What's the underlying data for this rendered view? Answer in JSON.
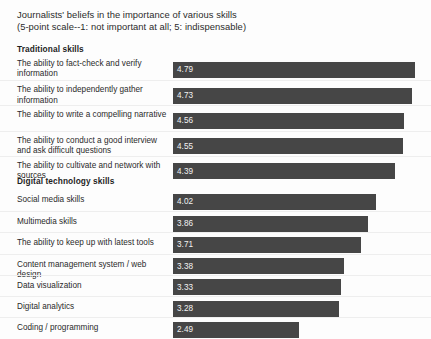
{
  "chart_data": {
    "type": "bar",
    "title": "Journalists' beliefs in the importance of various skills",
    "subtitle": "(5-point scale--1: not important at all; 5: indispensable)",
    "xlabel": "",
    "ylabel": "",
    "xlim": [
      0,
      5
    ],
    "grid": false,
    "legend": "none",
    "orientation": "horizontal",
    "value_labels_inside_bars": true,
    "bar_color": "#464646",
    "groups": [
      {
        "name": "Traditional skills",
        "categories": [
          "The ability to fact-check and verify information",
          "The ability to independently gather information",
          "The ability to write a compelling narrative",
          "The ability to conduct a good interview and ask difficult questions",
          "The ability to cultivate and network with sources"
        ],
        "values": [
          4.79,
          4.73,
          4.56,
          4.55,
          4.39
        ]
      },
      {
        "name": "Digital technology skills",
        "categories": [
          "Social media skills",
          "Multimedia skills",
          "The ability to keep up with latest tools",
          "Content management system / web design",
          "Data visualization",
          "Digital analytics",
          "Coding / programming"
        ],
        "values": [
          4.02,
          3.86,
          3.71,
          3.38,
          3.33,
          3.28,
          2.49
        ]
      }
    ]
  },
  "title": {
    "line1": "Journalists' beliefs in the importance of various skills",
    "line2": "(5-point scale--1: not important at all; 5: indispensable)"
  },
  "sections": [
    {
      "heading": "Traditional skills",
      "rows": [
        {
          "label": "The ability to fact-check and verify information",
          "value": "4.79",
          "num": 4.79
        },
        {
          "label": "The ability to independently gather information",
          "value": "4.73",
          "num": 4.73
        },
        {
          "label": "The ability to write a compelling narrative",
          "value": "4.56",
          "num": 4.56
        },
        {
          "label": "The ability to conduct a good interview and ask difficult questions",
          "value": "4.55",
          "num": 4.55
        },
        {
          "label": "The ability to cultivate and network with sources",
          "value": "4.39",
          "num": 4.39
        }
      ]
    },
    {
      "heading": "Digital technology skills",
      "rows": [
        {
          "label": "Social media skills",
          "value": "4.02",
          "num": 4.02
        },
        {
          "label": "Multimedia skills",
          "value": "3.86",
          "num": 3.86
        },
        {
          "label": "The ability to keep up with latest tools",
          "value": "3.71",
          "num": 3.71
        },
        {
          "label": "Content management system / web design",
          "value": "3.38",
          "num": 3.38
        },
        {
          "label": "Data visualization",
          "value": "3.33",
          "num": 3.33
        },
        {
          "label": "Digital analytics",
          "value": "3.28",
          "num": 3.28
        },
        {
          "label": "Coding / programming",
          "value": "2.49",
          "num": 2.49
        }
      ]
    }
  ]
}
